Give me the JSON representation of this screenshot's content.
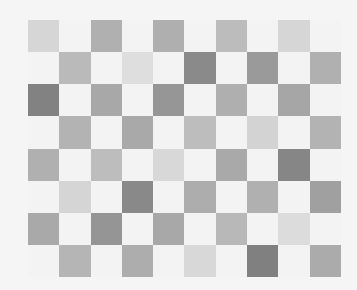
{
  "grid": {
    "columns": 10,
    "rows": 8,
    "background": "#f3f3f3",
    "cells": [
      [
        "#d6d6d6",
        "#f3f3f3",
        "#b0b0b0",
        "#f3f3f3",
        "#afafaf",
        "#f3f3f3",
        "#bcbcbc",
        "#f3f3f3",
        "#d6d6d6",
        "#f3f3f3"
      ],
      [
        "#f3f3f3",
        "#bababa",
        "#f3f3f3",
        "#dedede",
        "#f3f3f3",
        "#8a8a8a",
        "#f3f3f3",
        "#9a9a9a",
        "#f3f3f3",
        "#b0b0b0"
      ],
      [
        "#828282",
        "#f3f3f3",
        "#a8a8a8",
        "#f3f3f3",
        "#969696",
        "#f3f3f3",
        "#afafaf",
        "#f3f3f3",
        "#a6a6a6",
        "#f3f3f3"
      ],
      [
        "#f3f3f3",
        "#b3b3b3",
        "#f3f3f3",
        "#a9a9a9",
        "#f3f3f3",
        "#bdbdbd",
        "#f3f3f3",
        "#d3d3d3",
        "#f3f3f3",
        "#b3b3b3"
      ],
      [
        "#b0b0b0",
        "#f3f3f3",
        "#bdbdbd",
        "#f3f3f3",
        "#d8d8d8",
        "#f3f3f3",
        "#a9a9a9",
        "#f3f3f3",
        "#868686",
        "#f3f3f3"
      ],
      [
        "#f3f3f3",
        "#d5d5d5",
        "#f3f3f3",
        "#898989",
        "#f3f3f3",
        "#adadad",
        "#f3f3f3",
        "#b0b0b0",
        "#f3f3f3",
        "#a0a0a0"
      ],
      [
        "#a9a9a9",
        "#f3f3f3",
        "#959595",
        "#f3f3f3",
        "#a8a8a8",
        "#f3f3f3",
        "#b8b8b8",
        "#f3f3f3",
        "#dcdcdc",
        "#f3f3f3"
      ],
      [
        "#f3f3f3",
        "#b5b5b5",
        "#f3f3f3",
        "#adadad",
        "#f3f3f3",
        "#d8d8d8",
        "#f3f3f3",
        "#808080",
        "#f3f3f3",
        "#ababab"
      ]
    ]
  }
}
